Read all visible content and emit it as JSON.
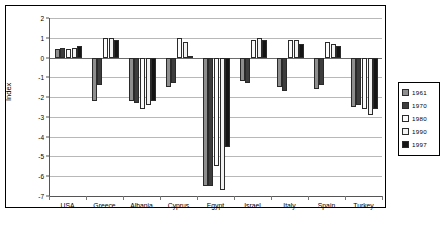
{
  "chart_data": {
    "type": "bar",
    "title": "",
    "xlabel": "",
    "ylabel": "Index",
    "ylim": [
      -7,
      2
    ],
    "yticks": [
      "2",
      "1",
      "0",
      "-1",
      "-2",
      "-3",
      "-4",
      "-5",
      "-6",
      "-7"
    ],
    "grid": true,
    "legend_position": "right",
    "categories": [
      "USA",
      "Greece",
      "Albania",
      "Cyprus",
      "Egypt",
      "Israel",
      "Italy",
      "Spain",
      "Turkey"
    ],
    "series": [
      {
        "name": "1961",
        "color": "#8e8e8e",
        "values": [
          0.45,
          -2.2,
          -2.2,
          -1.5,
          -6.5,
          -1.2,
          -1.5,
          -1.6,
          -2.5
        ]
      },
      {
        "name": "1970",
        "color": "#3d3d3d",
        "values": [
          0.5,
          -1.4,
          -2.3,
          -1.3,
          -6.5,
          -1.3,
          -1.7,
          -1.4,
          -2.4
        ]
      },
      {
        "name": "1980",
        "color": "#fbfbfb",
        "values": [
          0.45,
          1.0,
          -2.6,
          1.0,
          -5.5,
          0.9,
          0.9,
          0.8,
          -2.6
        ]
      },
      {
        "name": "1990",
        "color": "#f2f2f2",
        "values": [
          0.5,
          1.0,
          -2.4,
          0.8,
          -6.7,
          1.0,
          0.9,
          0.7,
          -2.9
        ]
      },
      {
        "name": "1997",
        "color": "#141414",
        "values": [
          0.6,
          0.9,
          -2.2,
          0.1,
          -4.5,
          0.9,
          0.7,
          0.6,
          -2.6
        ]
      }
    ]
  },
  "legend": {
    "items": [
      {
        "label": "1961"
      },
      {
        "label": "1970"
      },
      {
        "label": "1980"
      },
      {
        "label": "1990"
      },
      {
        "label": "1997"
      }
    ]
  }
}
